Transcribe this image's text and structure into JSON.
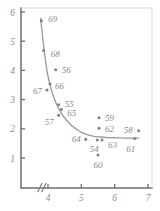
{
  "chart_data": {
    "type": "scatter",
    "title": "",
    "subtitle": "",
    "xlabel": "",
    "ylabel": "",
    "xlim": [
      3.55,
      7.05
    ],
    "ylim": [
      0.45,
      6.1
    ],
    "grid": false,
    "legend": null,
    "axis_break": {
      "axis": "x",
      "symbol": "//",
      "position": 3.75
    },
    "xticks": [
      4,
      5,
      6,
      7
    ],
    "xtick_labels": [
      "4",
      "5",
      "6",
      "7"
    ],
    "yticks": [
      1,
      2,
      3,
      4,
      5,
      6
    ],
    "ytick_labels": [
      "1",
      "2",
      "3",
      "4",
      "5",
      "6"
    ],
    "point_label_key": "year",
    "points": [
      {
        "label": "69",
        "x": 3.8,
        "y": 5.7,
        "label_dx": 7,
        "label_dy": -2
      },
      {
        "label": "68",
        "x": 3.87,
        "y": 4.68,
        "label_dx": 7,
        "label_dy": 3
      },
      {
        "label": "56",
        "x": 4.23,
        "y": 4.02,
        "label_dx": 6,
        "label_dy": 0
      },
      {
        "label": "66",
        "x": 4.06,
        "y": 3.53,
        "label_dx": 5,
        "label_dy": 2
      },
      {
        "label": "67",
        "x": 3.97,
        "y": 3.33,
        "label_dx": -14,
        "label_dy": 1
      },
      {
        "label": "55",
        "x": 4.32,
        "y": 2.82,
        "label_dx": 6,
        "label_dy": -1
      },
      {
        "label": "65",
        "x": 4.4,
        "y": 2.66,
        "label_dx": 6,
        "label_dy": 3
      },
      {
        "label": "57",
        "x": 4.32,
        "y": 2.46,
        "label_dx": -14,
        "label_dy": 7
      },
      {
        "label": "59",
        "x": 5.53,
        "y": 2.38,
        "label_dx": 6,
        "label_dy": 0
      },
      {
        "label": "62",
        "x": 5.53,
        "y": 2.02,
        "label_dx": 6,
        "label_dy": 1
      },
      {
        "label": "58",
        "x": 6.72,
        "y": 1.93,
        "label_dx": -15,
        "label_dy": -1
      },
      {
        "label": "64",
        "x": 5.13,
        "y": 1.64,
        "label_dx": -14,
        "label_dy": 0
      },
      {
        "label": "54",
        "x": 5.48,
        "y": 1.62,
        "label_dx": -3,
        "label_dy": 9
      },
      {
        "label": "63",
        "x": 5.62,
        "y": 1.62,
        "label_dx": 6,
        "label_dy": 5
      },
      {
        "label": "61",
        "x": 6.6,
        "y": 1.67,
        "label_dx": -4,
        "label_dy": 11
      },
      {
        "label": "60",
        "x": 5.5,
        "y": 1.1,
        "label_dx": 0,
        "label_dy": 10
      }
    ],
    "fit_curve": {
      "kind": "hyperbolic-decay",
      "points": [
        [
          3.78,
          5.78
        ],
        [
          3.82,
          5.35
        ],
        [
          3.86,
          4.92
        ],
        [
          3.9,
          4.55
        ],
        [
          3.95,
          4.14
        ],
        [
          4.0,
          3.8
        ],
        [
          4.06,
          3.52
        ],
        [
          4.12,
          3.26
        ],
        [
          4.2,
          3.0
        ],
        [
          4.3,
          2.74
        ],
        [
          4.42,
          2.5
        ],
        [
          4.55,
          2.3
        ],
        [
          4.7,
          2.12
        ],
        [
          4.85,
          1.99
        ],
        [
          5.0,
          1.88
        ],
        [
          5.15,
          1.81
        ],
        [
          5.35,
          1.75
        ],
        [
          5.55,
          1.72
        ],
        [
          5.8,
          1.7
        ],
        [
          6.1,
          1.69
        ],
        [
          6.4,
          1.68
        ],
        [
          6.72,
          1.68
        ]
      ]
    },
    "colors": {
      "axis": "#6f6f6f",
      "curve": "#9a9a9a",
      "point": "#808080",
      "label": "#8a8a8a",
      "background": "#ffffff"
    }
  },
  "geometry": {
    "plot_left": 21,
    "plot_right": 152,
    "plot_top": 8,
    "plot_bottom": 188,
    "x_pixel_at_4": 48,
    "x_pixel_at_7": 148,
    "y_pixel_at_6": 12,
    "y_pixel_at_1": 158
  }
}
